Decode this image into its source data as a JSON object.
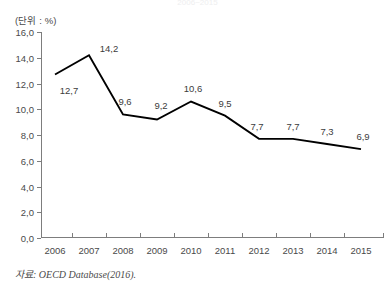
{
  "title_cropped": "2006~2015",
  "unit_label": "(단위 : %)",
  "source_note": "자료: OECD Database(2016).",
  "chart_data": {
    "type": "line",
    "title": "",
    "xlabel": "",
    "ylabel": "",
    "unit": "%",
    "categories": [
      "2006",
      "2007",
      "2008",
      "2009",
      "2010",
      "2011",
      "2012",
      "2013",
      "2014",
      "2015"
    ],
    "values": [
      12.7,
      14.2,
      9.6,
      9.2,
      10.6,
      9.5,
      7.7,
      7.7,
      7.3,
      6.9
    ],
    "point_labels": [
      "12,7",
      "14,2",
      "9,6",
      "9,2",
      "10,6",
      "9,5",
      "7,7",
      "7,7",
      "7,3",
      "6,9"
    ],
    "ylim": [
      0,
      16
    ],
    "ytick_values": [
      0,
      2,
      4,
      6,
      8,
      10,
      12,
      14,
      16
    ],
    "ytick_labels": [
      "0,0",
      "2,0",
      "4,0",
      "6,0",
      "8,0",
      "10,0",
      "12,0",
      "14,0",
      "16,0"
    ],
    "grid": false,
    "legend": false,
    "legend_position": "none",
    "line_color": "#000000",
    "axis_color": "#7d7d7d",
    "markers": false,
    "decimal_separator": ","
  }
}
